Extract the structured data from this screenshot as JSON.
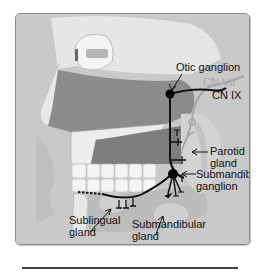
{
  "figure": {
    "labels": {
      "otic_ganglion": "Otic ganglion",
      "cn_vii": "CN VII",
      "cn_ix": "CN IX",
      "parotid_gland": "Parotid\ngland",
      "parotid_line1": "Parotid",
      "parotid_line2": "gland",
      "submandibular_ganglion_line1": "Submandibular",
      "submandibular_ganglion_line2": "ganglion",
      "sublingual_line1": "Sublingual",
      "sublingual_line2": "gland",
      "submandibular_gland_line1": "Submandibular",
      "submandibular_gland_line2": "gland"
    },
    "colors": {
      "panel_bg": "#c9c9c9",
      "soft_tissue": "#8c8c8c",
      "bone": "#e4e4e4",
      "nerve_cn_ix": "#111111",
      "nerve_cn_vii": "#a8a8a8",
      "gland": "#bdbdbd"
    }
  }
}
